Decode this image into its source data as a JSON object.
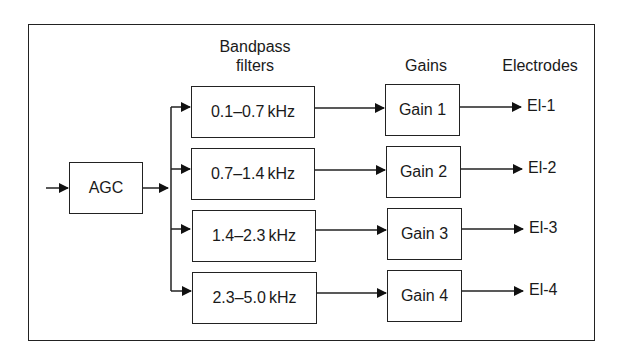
{
  "headers": {
    "bandpass": "Bandpass\nfilters",
    "bandpass_line1": "Bandpass",
    "bandpass_line2": "filters",
    "gains": "Gains",
    "electrodes": "Electrodes"
  },
  "agc": {
    "label": "AGC"
  },
  "filters": [
    {
      "label": "0.1–0.7 kHz"
    },
    {
      "label": "0.7–1.4 kHz"
    },
    {
      "label": "1.4–2.3 kHz"
    },
    {
      "label": "2.3–5.0 kHz"
    }
  ],
  "gains": [
    {
      "label": "Gain 1"
    },
    {
      "label": "Gain 2"
    },
    {
      "label": "Gain 3"
    },
    {
      "label": "Gain 4"
    }
  ],
  "electrodes": [
    {
      "label": "El-1"
    },
    {
      "label": "El-2"
    },
    {
      "label": "El-3"
    },
    {
      "label": "El-4"
    }
  ],
  "colors": {
    "line": "#222222",
    "background": "#ffffff"
  }
}
